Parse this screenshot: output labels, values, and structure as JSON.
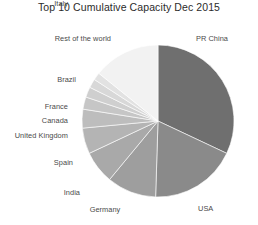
{
  "chart_data": {
    "type": "pie",
    "title": "Top 10 Cumulative Capacity Dec 2015",
    "subtitle": "",
    "xlabel": "",
    "ylabel": "",
    "legend_position": "none",
    "grid": false,
    "labels_outside": true,
    "start_angle_deg": 0,
    "direction": "clockwise",
    "categories": [
      "PR China",
      "USA",
      "Germany",
      "India",
      "Spain",
      "United Kingdom",
      "Canada",
      "France",
      "Italy",
      "Brazil",
      "Rest of the world"
    ],
    "values": [
      32.0,
      18.5,
      10.5,
      7.0,
      5.5,
      4.0,
      2.6,
      2.2,
      1.9,
      1.6,
      14.2
    ],
    "value_unit": "percent",
    "slice_colors": [
      "#6f6f6f",
      "#8a8a8a",
      "#9e9e9e",
      "#a9a9a9",
      "#b4b4b4",
      "#bdbdbd",
      "#c6c6c6",
      "#cfcfcf",
      "#d8d8d8",
      "#e2e2e2",
      "#f2f2f2"
    ],
    "slice_label_text": [
      "PR China",
      "USA",
      "Germany",
      "India",
      "Spain",
      "United Kingdom",
      "Canada",
      "France",
      "Italy",
      "Brazil",
      "Rest of the world"
    ]
  },
  "labels": {
    "pr_china": "PR China",
    "usa": "USA",
    "germany": "Germany",
    "india": "India",
    "spain": "Spain",
    "united_kingdom": "United Kingdom",
    "canada": "Canada",
    "france": "France",
    "italy": "Italy",
    "brazil": "Brazil",
    "rest_of_the_world": "Rest of the world"
  },
  "geometry": {
    "center_x": 158,
    "center_y": 121,
    "radius": 76
  },
  "colors": {
    "background": "#ffffff",
    "title_text": "#2b2b2b",
    "label_text": "#4a4a4a"
  }
}
